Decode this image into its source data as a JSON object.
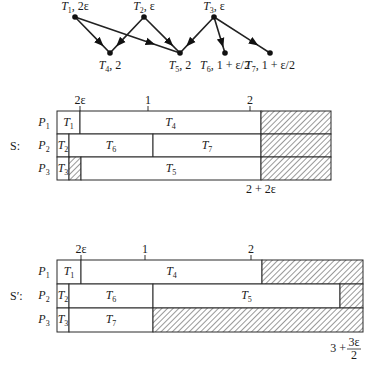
{
  "graph": {
    "nodes": [
      {
        "id": "T1",
        "label": "T",
        "sub": "1",
        "weight": "2ε",
        "x": 75,
        "y": 17
      },
      {
        "id": "T2",
        "label": "T",
        "sub": "2",
        "weight": "ε",
        "x": 144,
        "y": 17
      },
      {
        "id": "T3",
        "label": "T",
        "sub": "3",
        "weight": "ε",
        "x": 214,
        "y": 17
      },
      {
        "id": "T4",
        "label": "T",
        "sub": "4",
        "weight": "2",
        "x": 110,
        "y": 53
      },
      {
        "id": "T5",
        "label": "T",
        "sub": "5",
        "weight": "2",
        "x": 180,
        "y": 53
      },
      {
        "id": "T6",
        "label": "T",
        "sub": "6",
        "weight": "1 + ε/2",
        "x": 225,
        "y": 53
      },
      {
        "id": "T7",
        "label": "T",
        "sub": "7",
        "weight": "1 + ε/2",
        "x": 270,
        "y": 53
      }
    ],
    "edges": [
      {
        "from": "T1",
        "to": "T4"
      },
      {
        "from": "T1",
        "to": "T5"
      },
      {
        "from": "T2",
        "to": "T4"
      },
      {
        "from": "T2",
        "to": "T5"
      },
      {
        "from": "T3",
        "to": "T5"
      },
      {
        "from": "T3",
        "to": "T6"
      },
      {
        "from": "T3",
        "to": "T7"
      }
    ]
  },
  "schedule_S": {
    "name": "S:",
    "processors": [
      "P1",
      "P2",
      "P3"
    ],
    "ticks": [
      {
        "label": "2ε",
        "x": 80
      },
      {
        "label": "1",
        "x": 148
      },
      {
        "label": "2",
        "x": 250
      }
    ],
    "end_label": "2 + 2ε",
    "rows": [
      [
        {
          "task": "T1",
          "from": 57,
          "to": 80
        },
        {
          "task": "T4",
          "from": 80,
          "to": 261
        },
        {
          "idle": true,
          "from": 261,
          "to": 331
        }
      ],
      [
        {
          "task": "T2",
          "from": 57,
          "to": 69
        },
        {
          "task": "T6",
          "from": 69,
          "to": 153
        },
        {
          "task": "T7",
          "from": 153,
          "to": 261
        },
        {
          "idle": true,
          "from": 261,
          "to": 331
        }
      ],
      [
        {
          "task": "T3",
          "from": 57,
          "to": 69
        },
        {
          "idle": true,
          "from": 69,
          "to": 81
        },
        {
          "task": "T5",
          "from": 81,
          "to": 261
        },
        {
          "idle": true,
          "from": 261,
          "to": 331
        }
      ]
    ]
  },
  "schedule_S_prime": {
    "name": "S′:",
    "processors": [
      "P1",
      "P2",
      "P3"
    ],
    "ticks": [
      {
        "label": "2ε",
        "x": 81
      },
      {
        "label": "1",
        "x": 145
      },
      {
        "label": "2",
        "x": 251
      }
    ],
    "end_label_num": "3 + ",
    "end_label_frac_top": "3ε",
    "end_label_frac_bottom": "2",
    "rows": [
      [
        {
          "task": "T1",
          "from": 57,
          "to": 81
        },
        {
          "task": "T4",
          "from": 81,
          "to": 262
        },
        {
          "idle": true,
          "from": 262,
          "to": 363
        }
      ],
      [
        {
          "task": "T2",
          "from": 57,
          "to": 69
        },
        {
          "task": "T6",
          "from": 69,
          "to": 153
        },
        {
          "task": "T5",
          "from": 153,
          "to": 340
        },
        {
          "idle": true,
          "from": 340,
          "to": 363
        }
      ],
      [
        {
          "task": "T3",
          "from": 57,
          "to": 69
        },
        {
          "task": "T7",
          "from": 69,
          "to": 153
        },
        {
          "idle": true,
          "from": 153,
          "to": 363
        }
      ]
    ]
  },
  "chart_data": [
    {
      "type": "gantt",
      "title": "S:",
      "processors": [
        "P1",
        "P2",
        "P3"
      ],
      "tasks": [
        {
          "processor": "P1",
          "task": "T1",
          "start": "0",
          "end": "2ε"
        },
        {
          "processor": "P1",
          "task": "T4",
          "start": "2ε",
          "end": "2 + 2ε"
        },
        {
          "processor": "P2",
          "task": "T2",
          "start": "0",
          "end": "ε"
        },
        {
          "processor": "P2",
          "task": "T6",
          "start": "ε",
          "end": "1 + 3ε/2"
        },
        {
          "processor": "P2",
          "task": "T7",
          "start": "1 + 3ε/2",
          "end": "2 + 2ε"
        },
        {
          "processor": "P3",
          "task": "T3",
          "start": "0",
          "end": "ε"
        },
        {
          "processor": "P3",
          "task": "idle",
          "start": "ε",
          "end": "2ε"
        },
        {
          "processor": "P3",
          "task": "T5",
          "start": "2ε",
          "end": "2 + 2ε"
        }
      ],
      "tick_labels": [
        "2ε",
        "1",
        "2"
      ],
      "makespan": "2 + 2ε"
    },
    {
      "type": "gantt",
      "title": "S′:",
      "processors": [
        "P1",
        "P2",
        "P3"
      ],
      "tasks": [
        {
          "processor": "P1",
          "task": "T1",
          "start": "0",
          "end": "2ε"
        },
        {
          "processor": "P1",
          "task": "T4",
          "start": "2ε",
          "end": "2 + 2ε"
        },
        {
          "processor": "P2",
          "task": "T2",
          "start": "0",
          "end": "ε"
        },
        {
          "processor": "P2",
          "task": "T6",
          "start": "ε",
          "end": "1 + 3ε/2"
        },
        {
          "processor": "P2",
          "task": "T5",
          "start": "1 + 3ε/2",
          "end": "3 + 3ε/2"
        },
        {
          "processor": "P3",
          "task": "T3",
          "start": "0",
          "end": "ε"
        },
        {
          "processor": "P3",
          "task": "T7",
          "start": "ε",
          "end": "1 + 3ε/2"
        }
      ],
      "tick_labels": [
        "2ε",
        "1",
        "2"
      ],
      "makespan": "3 + 3ε/2"
    }
  ]
}
